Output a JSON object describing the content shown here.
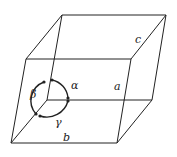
{
  "diagram": {
    "edge_labels": {
      "a": "a",
      "b": "b",
      "c": "c"
    },
    "angle_labels": {
      "alpha": "α",
      "beta": "β",
      "gamma": "γ"
    },
    "colors": {
      "stroke": "#222222",
      "background": "#ffffff"
    }
  }
}
